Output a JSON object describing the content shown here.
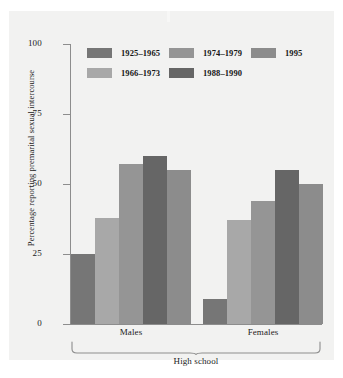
{
  "chart_data": {
    "type": "bar",
    "title": "",
    "subtitle": "",
    "xlabel": "High school",
    "ylabel": "Percentage reporting premarital sexual intercourse",
    "ylim": [
      0,
      100
    ],
    "ytick_labels": [
      "100",
      "75",
      "50",
      "25",
      "0"
    ],
    "ytick_values": [
      100,
      75,
      50,
      25,
      0
    ],
    "grid": false,
    "legend_position": "top-inside",
    "categories": [
      "Males",
      "Females"
    ],
    "series": [
      {
        "name": "1925–1965",
        "color": "#767676",
        "values": [
          25,
          9
        ]
      },
      {
        "name": "1966–1973",
        "color": "#a8a8a8",
        "values": [
          38,
          37
        ]
      },
      {
        "name": "1974–1979",
        "color": "#959595",
        "values": [
          57,
          44
        ]
      },
      {
        "name": "1988–1990",
        "color": "#666666",
        "values": [
          60,
          55
        ]
      },
      {
        "name": "1995",
        "color": "#8c8c8c",
        "values": [
          55,
          50
        ]
      }
    ],
    "annotations": [
      {
        "text": "High school",
        "kind": "brace-label"
      }
    ]
  },
  "axis": {
    "y_title": "Percentage reporting premarital sexual intercourse",
    "ticks": [
      "100",
      "75",
      "50",
      "25",
      "0"
    ]
  },
  "legend": {
    "rows": [
      [
        {
          "label": "1925–1965",
          "color": "#767676"
        },
        {
          "label": "1974–1979",
          "color": "#959595"
        },
        {
          "label": "1995",
          "color": "#8c8c8c"
        }
      ],
      [
        {
          "label": "1966–1973",
          "color": "#a8a8a8"
        },
        {
          "label": "1988–1990",
          "color": "#666666"
        }
      ]
    ]
  },
  "groups": [
    {
      "label": "Males"
    },
    {
      "label": "Females"
    }
  ],
  "supergroup": {
    "label": "High school"
  },
  "colors": {
    "panel_background": "#f2f2f1",
    "page_background": "#ffffff",
    "axis": "#8d8d8d",
    "text": "#1b1b1b"
  }
}
